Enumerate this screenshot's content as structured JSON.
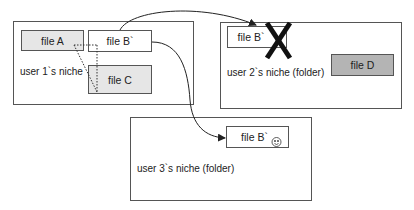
{
  "colors": {
    "file_light_fill": "#e6e6e6",
    "file_dark_fill": "#b4b4b4",
    "file_white_fill": "#ffffff",
    "border": "#555555",
    "arrow": "#222222",
    "cross": "#111111"
  },
  "niches": [
    {
      "label": "user 1`s niche",
      "files": [
        {
          "label": "file A",
          "fill": "light"
        },
        {
          "label": "file B`",
          "fill": "white"
        },
        {
          "label": "file C",
          "fill": "light"
        }
      ]
    },
    {
      "label": "user 2`s niche (folder)",
      "files": [
        {
          "label": "file B`",
          "fill": "white",
          "marker": "cross-icon"
        },
        {
          "label": "file D",
          "fill": "dark"
        }
      ]
    },
    {
      "label": "user 3`s niche (folder)",
      "files": [
        {
          "label": "file B`",
          "fill": "white",
          "marker": "smiley-icon"
        }
      ]
    }
  ],
  "arrows": [
    {
      "from": "user 1 file B`",
      "to": "user 2 file B`"
    },
    {
      "from": "user 1 file B`",
      "to": "user 3 file B`"
    }
  ],
  "dotted_links": [
    {
      "between": [
        "file A",
        "file B`",
        "file C"
      ]
    }
  ]
}
